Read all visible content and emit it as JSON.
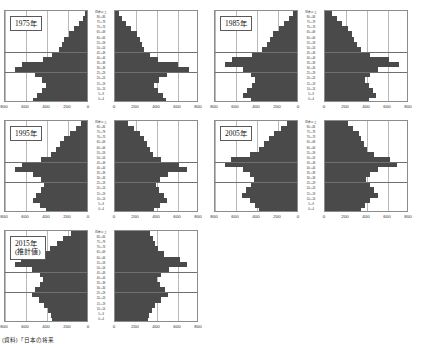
{
  "source_note": "(資料)「日本の将来",
  "axis": {
    "left_ticks": [
      "800",
      "600",
      "400",
      "200",
      "0"
    ],
    "right_ticks": [
      "0",
      "200",
      "400",
      "600",
      "800"
    ],
    "max": 800,
    "unit_implied": "千人"
  },
  "age_labels": [
    "85歳以上",
    "80～84",
    "75～79",
    "70～74",
    "65～69",
    "60～64",
    "55～59",
    "50～54",
    "45～49",
    "40～44",
    "35～39",
    "30～34",
    "25～29",
    "20～24",
    "15～19",
    "10～14",
    "5～9",
    "0～4"
  ],
  "colors": {
    "bar": "#4a4a4a",
    "frame": "#8c8c8c",
    "grid": "#b9b9b9",
    "highlight": "#6f6f6f",
    "background": "#ffffff"
  },
  "chart_data": {
    "type": "bar",
    "title": "",
    "xlabel": "",
    "ylabel": "",
    "xlim": [
      0,
      800
    ],
    "grid": true,
    "legend": "none",
    "orientation": "horizontal-mirrored",
    "categories": [
      "85歳以上",
      "80～84",
      "75～79",
      "70～74",
      "65～69",
      "60～64",
      "55～59",
      "50～54",
      "45～49",
      "40～44",
      "35～39",
      "30～34",
      "25～29",
      "20～24",
      "15～19",
      "10～14",
      "5～9",
      "0～4"
    ],
    "panels": [
      {
        "label": "1975年",
        "label_lines": [
          "1975年"
        ],
        "highlight_band": [
          "45～49",
          "30～34"
        ],
        "series": [
          {
            "name": "男",
            "side": "left",
            "values": [
              20,
              40,
              75,
              120,
              175,
              215,
              240,
              265,
              330,
              420,
              620,
              690,
              500,
              430,
              390,
              425,
              480,
              510
            ]
          },
          {
            "name": "女",
            "side": "right",
            "values": [
              38,
              65,
              105,
              155,
              205,
              240,
              260,
              275,
              330,
              410,
              600,
              700,
              495,
              420,
              375,
              405,
              460,
              485
            ]
          }
        ]
      },
      {
        "label": "1985年",
        "label_lines": [
          "1985年"
        ],
        "highlight_band": [
          "45～49",
          "30～34"
        ],
        "series": [
          {
            "name": "男",
            "side": "left",
            "values": [
              35,
              75,
              120,
              175,
              225,
              255,
              290,
              330,
              430,
              620,
              690,
              510,
              435,
              400,
              430,
              480,
              510,
              440
            ]
          },
          {
            "name": "女",
            "side": "right",
            "values": [
              70,
              115,
              165,
              215,
              255,
              280,
              305,
              340,
              425,
              605,
              700,
              505,
              425,
              385,
              415,
              460,
              490,
              420
            ]
          }
        ]
      },
      {
        "label": "1995年",
        "label_lines": [
          "1995年"
        ],
        "highlight_band": [
          "45～49",
          "30～34"
        ],
        "series": [
          {
            "name": "男",
            "side": "left",
            "values": [
              60,
              105,
              160,
              215,
              260,
              300,
              345,
              440,
              620,
              690,
              510,
              440,
              405,
              435,
              485,
              515,
              445,
              395
            ]
          },
          {
            "name": "女",
            "side": "right",
            "values": [
              125,
              180,
              235,
              275,
              300,
              330,
              360,
              440,
              605,
              690,
              505,
              430,
              390,
              420,
              465,
              495,
              425,
              375
            ]
          }
        ]
      },
      {
        "label": "2005年",
        "label_lines": [
          "2005年"
        ],
        "highlight_band": [
          "45～49",
          "30～34"
        ],
        "series": [
          {
            "name": "男",
            "side": "left",
            "values": [
              95,
              150,
              215,
              265,
              310,
              360,
              450,
              625,
              690,
              515,
              445,
              410,
              440,
              490,
              520,
              450,
              400,
              365
            ]
          },
          {
            "name": "女",
            "side": "right",
            "values": [
              215,
              270,
              320,
              345,
              370,
              400,
              465,
              615,
              685,
              505,
              430,
              395,
              425,
              470,
              500,
              430,
              380,
              345
            ]
          }
        ]
      },
      {
        "label": "2015年(推計値)",
        "label_lines": [
          "2015年",
          "(推計値)"
        ],
        "highlight_band": [
          "45～49",
          "30～34"
        ],
        "series": [
          {
            "name": "男",
            "side": "left",
            "values": [
              150,
              225,
              290,
              350,
              460,
              625,
              690,
              520,
              450,
              415,
              445,
              495,
              520,
              455,
              405,
              370,
              345,
              330
            ]
          },
          {
            "name": "女",
            "side": "right",
            "values": [
              330,
              360,
              385,
              405,
              470,
              615,
              685,
              510,
              435,
              400,
              430,
              475,
              500,
              435,
              385,
              350,
              325,
              312
            ]
          }
        ]
      }
    ]
  }
}
